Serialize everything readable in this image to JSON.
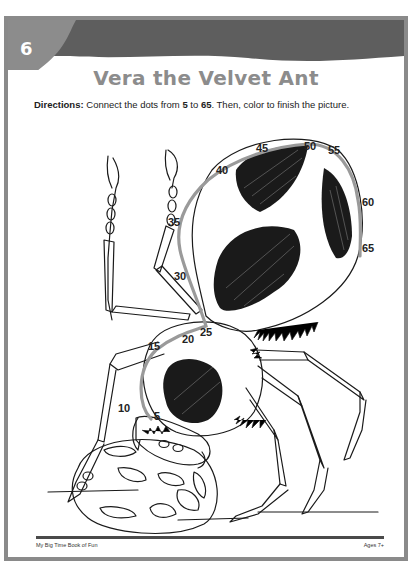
{
  "page": {
    "number": "6",
    "title": "Vera the Velvet Ant",
    "directions": {
      "label": "Directions:",
      "text_before": " Connect the dots from ",
      "start": "5",
      "text_middle": " to ",
      "end": "65",
      "text_after": ". Then, color to finish the picture."
    }
  },
  "dots": [
    {
      "label": "5",
      "x": 143,
      "y": 399
    },
    {
      "label": "10",
      "x": 118,
      "y": 387
    },
    {
      "label": "15",
      "x": 146,
      "y": 330
    },
    {
      "label": "20",
      "x": 179,
      "y": 322
    },
    {
      "label": "25",
      "x": 196,
      "y": 314
    },
    {
      "label": "30",
      "x": 171,
      "y": 259
    },
    {
      "label": "35",
      "x": 166,
      "y": 205
    },
    {
      "label": "40",
      "x": 213,
      "y": 154
    },
    {
      "label": "45",
      "x": 253,
      "y": 132
    },
    {
      "label": "50",
      "x": 302,
      "y": 130
    },
    {
      "label": "55",
      "x": 324,
      "y": 133
    },
    {
      "label": "60",
      "x": 354,
      "y": 185
    },
    {
      "label": "65",
      "x": 354,
      "y": 232
    }
  ],
  "footer": {
    "left": "My Big Time Book of Fun",
    "right": "Ages 7+"
  },
  "colors": {
    "frame": "#8a8a8a",
    "header_band": "#5e5e5e",
    "tab_circle": "#8c8c8c",
    "title": "#8c8c8c",
    "dot_path": "#9a9a9a",
    "ink": "#1a1a1a"
  }
}
